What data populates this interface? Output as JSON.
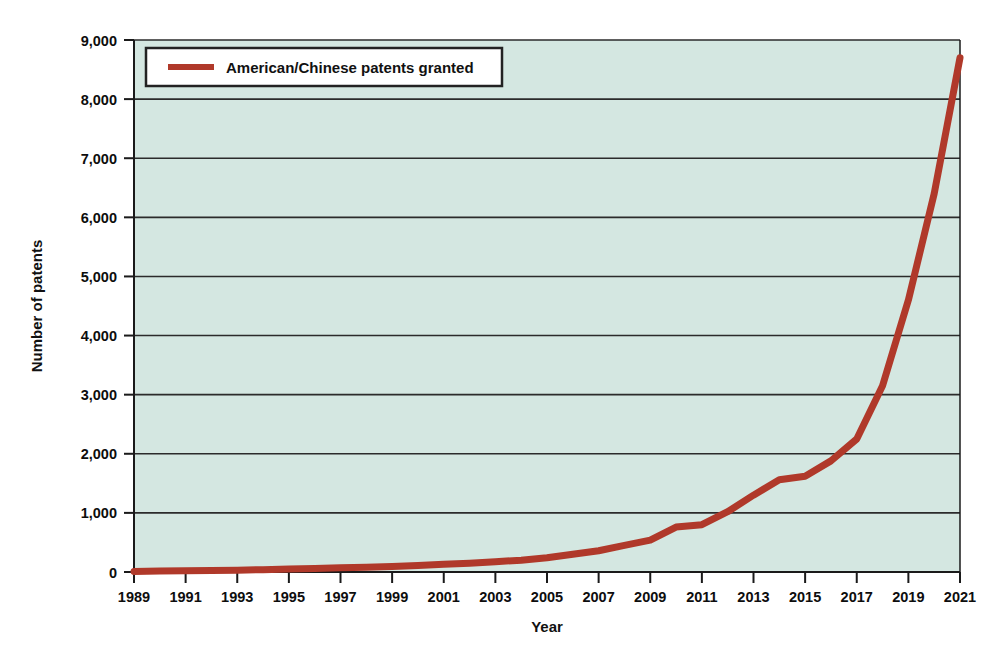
{
  "chart_data": {
    "type": "line",
    "title": "",
    "xlabel": "Year",
    "ylabel": "Number of patents",
    "xlim": [
      1989,
      2021
    ],
    "ylim": [
      0,
      9000
    ],
    "grid": true,
    "legend_position": "top-left-inside",
    "series": [
      {
        "name": "American/Chinese patents granted",
        "color": "#b0392a",
        "x": [
          1989,
          1990,
          1991,
          1992,
          1993,
          1994,
          1995,
          1996,
          1997,
          1998,
          1999,
          2000,
          2001,
          2002,
          2003,
          2004,
          2005,
          2006,
          2007,
          2008,
          2009,
          2010,
          2011,
          2012,
          2013,
          2014,
          2015,
          2016,
          2017,
          2018,
          2019,
          2020,
          2021
        ],
        "values": [
          10,
          15,
          20,
          25,
          30,
          40,
          50,
          60,
          70,
          80,
          95,
          110,
          130,
          150,
          175,
          200,
          240,
          300,
          360,
          450,
          540,
          760,
          800,
          1020,
          1300,
          1560,
          1620,
          1880,
          2250,
          3150,
          4600,
          6400,
          8700
        ]
      }
    ],
    "yticks": [
      0,
      1000,
      2000,
      3000,
      4000,
      5000,
      6000,
      7000,
      8000,
      9000
    ],
    "ytick_labels": [
      "0",
      "1,000",
      "2,000",
      "3,000",
      "4,000",
      "5,000",
      "6,000",
      "7,000",
      "8,000",
      "9,000"
    ],
    "xticks": [
      1989,
      1991,
      1993,
      1995,
      1997,
      1999,
      2001,
      2003,
      2005,
      2007,
      2009,
      2011,
      2013,
      2015,
      2017,
      2019,
      2021
    ],
    "xtick_labels": [
      "1989",
      "1991",
      "1993",
      "1995",
      "1997",
      "1999",
      "2001",
      "2003",
      "2005",
      "2007",
      "2009",
      "2011",
      "2013",
      "2015",
      "2017",
      "2019",
      "2021"
    ],
    "plot_background": "#d4e7e1",
    "gridline_color": "#2b2b2b",
    "axis_color": "#1a1a1a",
    "legend_entries": [
      {
        "label": "American/Chinese patents granted",
        "color": "#b0392a"
      }
    ]
  }
}
